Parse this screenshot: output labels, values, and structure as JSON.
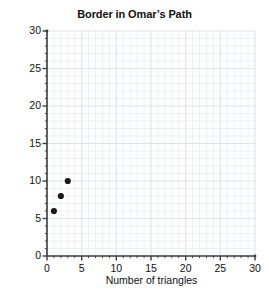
{
  "chart_data": {
    "type": "scatter",
    "title": "Border in Omar’s Path",
    "xlabel": "Number of triangles",
    "ylabel": "Number of border pieces",
    "x": [
      1,
      2,
      3
    ],
    "values": [
      6,
      8,
      10
    ],
    "points": [
      {
        "x": 1,
        "y": 6
      },
      {
        "x": 2,
        "y": 8
      },
      {
        "x": 3,
        "y": 10
      }
    ],
    "xlim": [
      0,
      30
    ],
    "ylim": [
      0,
      30
    ],
    "xticks": [
      0,
      5,
      10,
      15,
      20,
      25,
      30
    ],
    "yticks": [
      0,
      5,
      10,
      15,
      20,
      25,
      30
    ],
    "xtick_labels": [
      "0",
      "5",
      "10",
      "15",
      "20",
      "25",
      "30"
    ],
    "ytick_labels": [
      "0",
      "5",
      "10",
      "15",
      "20",
      "25",
      "30"
    ],
    "minor_tick_step": 1,
    "major_tick_step": 5,
    "grid": true,
    "grid_minor_color": "#e9ecef",
    "grid_major_color": "#dfe3e6",
    "axis_color": "#3d3d3d",
    "marker_color": "#1a1a1a",
    "marker_size": 3.1,
    "legend": null,
    "legend_position": "none"
  }
}
